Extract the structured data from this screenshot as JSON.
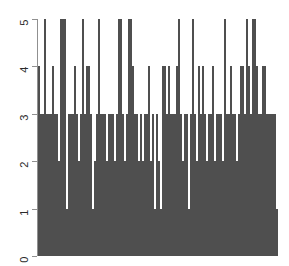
{
  "chart_data": {
    "type": "bar",
    "title": "",
    "subtitle": "",
    "xlabel": "",
    "ylabel": "",
    "grid": false,
    "legend": false,
    "legend_position": "none",
    "bar_color": "#808080",
    "bar_border_color": "#4f4f4f",
    "axis_color": "#909090",
    "background_color": "#ffffff",
    "xlim": [
      0,
      120
    ],
    "ylim": [
      0,
      5
    ],
    "y_ticks": [
      0,
      1,
      2,
      3,
      4,
      5
    ],
    "y_tick_labels": [
      "0",
      "1",
      "2",
      "3",
      "4",
      "5"
    ],
    "x_ticks": [],
    "x_tick_labels": [],
    "categories": [
      "1",
      "2",
      "3",
      "4",
      "5",
      "6",
      "7",
      "8",
      "9",
      "10",
      "11",
      "12",
      "13",
      "14",
      "15",
      "16",
      "17",
      "18",
      "19",
      "20",
      "21",
      "22",
      "23",
      "24",
      "25",
      "26",
      "27",
      "28",
      "29",
      "30",
      "31",
      "32",
      "33",
      "34",
      "35",
      "36",
      "37",
      "38",
      "39",
      "40",
      "41",
      "42",
      "43",
      "44",
      "45",
      "46",
      "47",
      "48",
      "49",
      "50",
      "51",
      "52",
      "53",
      "54",
      "55",
      "56",
      "57",
      "58",
      "59",
      "60",
      "61",
      "62",
      "63",
      "64",
      "65",
      "66",
      "67",
      "68",
      "69",
      "70",
      "71",
      "72",
      "73",
      "74",
      "75",
      "76",
      "77",
      "78",
      "79",
      "80",
      "81",
      "82",
      "83",
      "84",
      "85",
      "86",
      "87",
      "88",
      "89",
      "90",
      "91",
      "92",
      "93",
      "94",
      "95",
      "96",
      "97",
      "98",
      "99",
      "100",
      "101",
      "102",
      "103",
      "104",
      "105",
      "106",
      "107",
      "108",
      "109",
      "110",
      "111",
      "112",
      "113",
      "114",
      "115",
      "116",
      "117",
      "118",
      "119",
      "120"
    ],
    "values": [
      4,
      3,
      3,
      5,
      3,
      3,
      3,
      4,
      3,
      3,
      2,
      5,
      5,
      5,
      1,
      3,
      3,
      3,
      4,
      3,
      2,
      3,
      5,
      3,
      4,
      4,
      3,
      1,
      2,
      3,
      5,
      3,
      3,
      3,
      2,
      3,
      3,
      3,
      2,
      3,
      5,
      5,
      3,
      2,
      3,
      5,
      5,
      4,
      3,
      3,
      2,
      3,
      2,
      3,
      3,
      4,
      2,
      3,
      1,
      3,
      2,
      1,
      4,
      4,
      3,
      4,
      3,
      3,
      3,
      4,
      5,
      3,
      2,
      3,
      3,
      1,
      3,
      5,
      3,
      2,
      4,
      3,
      4,
      3,
      2,
      3,
      3,
      4,
      2,
      3,
      3,
      3,
      2,
      5,
      3,
      3,
      4,
      3,
      3,
      2,
      3,
      4,
      4,
      3,
      5,
      4,
      3,
      5,
      5,
      4,
      3,
      3,
      4,
      4,
      3,
      3,
      3,
      3,
      3,
      1
    ]
  },
  "axis": {
    "y_label_0": "0",
    "y_label_1": "1",
    "y_label_2": "2",
    "y_label_3": "3",
    "y_label_4": "4",
    "y_label_5": "5"
  }
}
